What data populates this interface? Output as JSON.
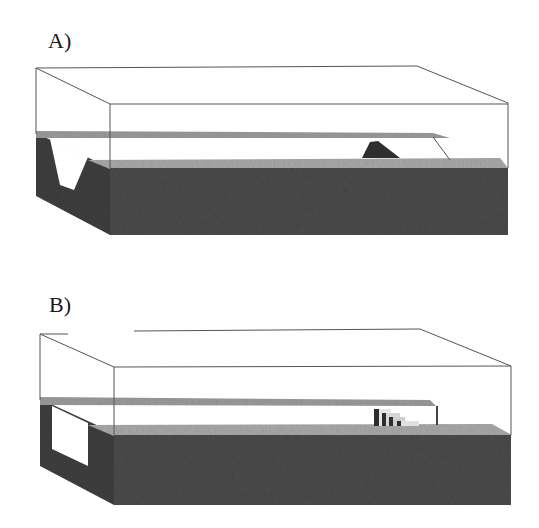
{
  "figure": {
    "panels": [
      {
        "id": "A",
        "label": "A)",
        "left_face_feature": "v-shaped channel cutout",
        "surface_feature": "triangular mound"
      },
      {
        "id": "B",
        "label": "B)",
        "left_face_feature": "rectangular cutout",
        "surface_feature": "stepped blocks"
      }
    ]
  },
  "colors": {
    "background": "#ffffff",
    "outline": "#555555",
    "water_band": "#9a9a9a",
    "sediment_top": "#a8a8a8",
    "dark_block": "#4a4a4a",
    "dark_face": "#3e3e3e",
    "mound": "#2e2e2e"
  }
}
